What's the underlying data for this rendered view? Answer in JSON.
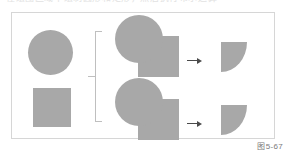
{
  "page": {
    "background_color": "#ffffff",
    "clipped_header_text": "在绘图区域中绘制圆形和矩形，然后执行布尔运算"
  },
  "figure": {
    "frame": {
      "border_color": "#d6d6d6",
      "background_color": "#ffffff"
    },
    "shape_fill_color": "#a8a8a8",
    "caption": "图5-67",
    "source_shapes": [
      {
        "name": "circle",
        "label": "圆形",
        "fill": "#a8a8a8"
      },
      {
        "name": "square",
        "label": "矩形",
        "fill": "#a8a8a8"
      }
    ],
    "bracket": {
      "name": "grouping-bracket",
      "color": "#bfbfbf",
      "orientation": "left"
    },
    "operations": [
      {
        "name": "operation-top",
        "operand_circle_label": "圆形",
        "operand_square_label": "矩形",
        "arrow_symbol": "→",
        "result_label": "四分之一圆角形"
      },
      {
        "name": "operation-bottom",
        "operand_circle_label": "圆形",
        "operand_square_label": "矩形",
        "arrow_symbol": "→",
        "result_label": "四分之一圆角形"
      }
    ]
  }
}
